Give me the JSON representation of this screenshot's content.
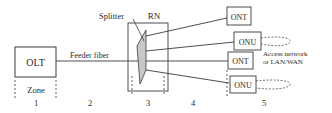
{
  "diagram": {
    "olt": {
      "label": "OLT"
    },
    "feeder": {
      "label": "Feeder fiber"
    },
    "splitter": {
      "label": "Splitter"
    },
    "rn": {
      "label": "RN"
    },
    "endpoints": [
      {
        "label": "ONT"
      },
      {
        "label": "ONU"
      },
      {
        "label": "ONT"
      },
      {
        "label": "ONU"
      }
    ],
    "access": {
      "line1": "Access network",
      "line2": "or LAN/WAN"
    },
    "zone": {
      "label": "Zone",
      "numbers": [
        "1",
        "2",
        "3",
        "4",
        "5"
      ]
    },
    "colors": {
      "line": "#3a3a3a",
      "splitter_fill": "#c8c8c8",
      "background": "#ffffff"
    }
  }
}
